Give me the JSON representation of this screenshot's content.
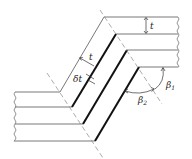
{
  "figure": {
    "labels": {
      "t_top": "t",
      "t_diag": "t",
      "delta_t": "δt",
      "beta1_base": "β",
      "beta1_sub": "1",
      "beta2_base": "β",
      "beta2_sub": "2"
    }
  }
}
